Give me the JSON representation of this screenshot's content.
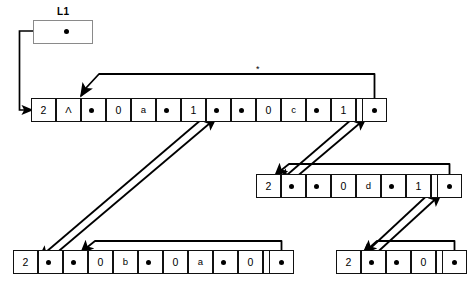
{
  "diagram": {
    "title": "L1",
    "root": {
      "label": "L1",
      "pointer_icon": "pointer-dot"
    },
    "annotation_star": "*",
    "lists": [
      {
        "id": "top-row",
        "name": "list-l1-top",
        "nodes": [
          {
            "id": "n1",
            "cells": [
              {
                "text": "2",
                "kind": "tag"
              },
              {
                "text": "Λ",
                "kind": "atom"
              },
              {
                "text": "",
                "kind": "pointer"
              }
            ]
          },
          {
            "id": "n2",
            "cells": [
              {
                "text": "0",
                "kind": "tag"
              },
              {
                "text": "a",
                "kind": "atom"
              },
              {
                "text": "",
                "kind": "pointer"
              }
            ]
          },
          {
            "id": "n3",
            "cells": [
              {
                "text": "1",
                "kind": "tag"
              },
              {
                "text": "",
                "kind": "pointer"
              },
              {
                "text": "",
                "kind": "pointer"
              }
            ]
          },
          {
            "id": "n4",
            "cells": [
              {
                "text": "0",
                "kind": "tag"
              },
              {
                "text": "c",
                "kind": "atom"
              },
              {
                "text": "",
                "kind": "pointer"
              }
            ]
          },
          {
            "id": "n5",
            "cells": [
              {
                "text": "1",
                "kind": "tag"
              },
              {
                "text": "",
                "kind": "pointer"
              },
              {
                "text": "",
                "kind": "pointer"
              }
            ]
          }
        ]
      },
      {
        "id": "mid-right-row",
        "name": "list-mid-right",
        "nodes": [
          {
            "id": "m1",
            "cells": [
              {
                "text": "2",
                "kind": "tag"
              },
              {
                "text": "",
                "kind": "pointer"
              },
              {
                "text": "",
                "kind": "pointer"
              }
            ]
          },
          {
            "id": "m2",
            "cells": [
              {
                "text": "0",
                "kind": "tag"
              },
              {
                "text": "d",
                "kind": "atom"
              },
              {
                "text": "",
                "kind": "pointer"
              }
            ]
          },
          {
            "id": "m3",
            "cells": [
              {
                "text": "1",
                "kind": "tag"
              },
              {
                "text": "",
                "kind": "pointer"
              },
              {
                "text": "",
                "kind": "pointer"
              }
            ]
          }
        ]
      },
      {
        "id": "bottom-left-row",
        "name": "list-bottom-left",
        "nodes": [
          {
            "id": "b1",
            "cells": [
              {
                "text": "2",
                "kind": "tag"
              },
              {
                "text": "",
                "kind": "pointer"
              },
              {
                "text": "",
                "kind": "pointer"
              }
            ]
          },
          {
            "id": "b2",
            "cells": [
              {
                "text": "0",
                "kind": "tag"
              },
              {
                "text": "b",
                "kind": "atom"
              },
              {
                "text": "",
                "kind": "pointer"
              }
            ]
          },
          {
            "id": "b3",
            "cells": [
              {
                "text": "0",
                "kind": "tag"
              },
              {
                "text": "a",
                "kind": "atom"
              },
              {
                "text": "",
                "kind": "pointer"
              }
            ]
          },
          {
            "id": "b4",
            "cells": [
              {
                "text": "0",
                "kind": "tag"
              },
              {
                "text": "b",
                "kind": "atom"
              },
              {
                "text": "",
                "kind": "pointer"
              }
            ]
          }
        ]
      },
      {
        "id": "bottom-right-row",
        "name": "list-bottom-right",
        "nodes": [
          {
            "id": "r1",
            "cells": [
              {
                "text": "2",
                "kind": "tag"
              },
              {
                "text": "",
                "kind": "pointer"
              },
              {
                "text": "",
                "kind": "pointer"
              }
            ]
          },
          {
            "id": "r2",
            "cells": [
              {
                "text": "0",
                "kind": "tag"
              },
              {
                "text": "e",
                "kind": "atom"
              },
              {
                "text": "",
                "kind": "pointer"
              }
            ]
          }
        ]
      }
    ],
    "colors": {
      "ink": "#000000",
      "cell_border": "#111111",
      "root_border": "#8a8a8a",
      "background": "#ffffff"
    }
  }
}
